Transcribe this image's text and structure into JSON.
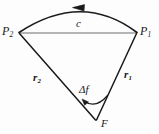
{
  "figure": {
    "type": "geometric-diagram",
    "background_color": "#fdfdfd",
    "stroke_color": "#1a1a1a",
    "chord_color": "#6e6e6e"
  },
  "labels": {
    "p1": "P",
    "p1_sub": "1",
    "p2": "P",
    "p2_sub": "2",
    "chord": "c",
    "r1": "r",
    "r1_sub": "1",
    "r2": "r",
    "r2_sub": "2",
    "delta_f": "Δf",
    "focus": "F"
  },
  "geometry": {
    "point_p1": [
      137,
      33
    ],
    "point_p2": [
      19,
      33
    ],
    "point_f": [
      96,
      121
    ],
    "arc_apex": [
      82,
      8
    ],
    "arc_arrow_direction": "left",
    "angle_arc_arrow_direction": "left"
  }
}
